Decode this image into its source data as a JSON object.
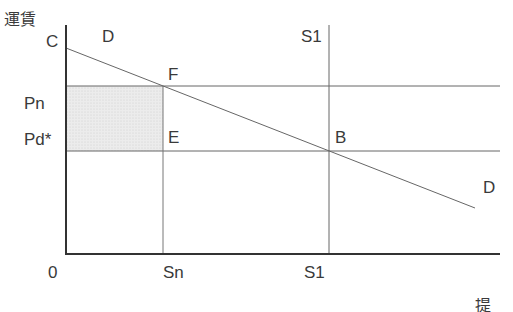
{
  "diagram": {
    "y_axis_label": "運賃",
    "x_axis_label_partial": "提",
    "origin_label": "0",
    "y_ticks": {
      "c": "C",
      "pn": "Pn",
      "pd": "Pd*"
    },
    "x_ticks": {
      "sn": "Sn",
      "s1": "S1"
    },
    "curve_labels": {
      "demand_top": "D",
      "demand_bottom": "D",
      "supply_top": "S1"
    },
    "points": {
      "f": "F",
      "e": "E",
      "b": "B"
    },
    "colors": {
      "axis": "#333333",
      "line": "#555555",
      "shade": "#e6e6e6"
    }
  }
}
